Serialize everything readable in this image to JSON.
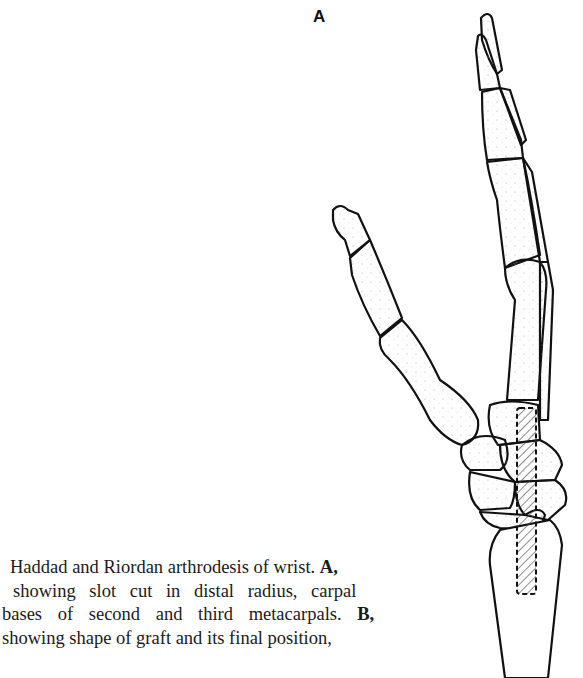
{
  "figure": {
    "panel_label": "A",
    "illustration": "Lateral view of hand and wrist bones: index and middle finger phalanges, metacarpals, carpals, distal radius with hatched slot (graft site) outlined by dashed line",
    "graft_hatch_color": "#333333",
    "line_color": "#111111"
  },
  "caption": {
    "lines": [
      {
        "text": "Haddad and Riordan arthrodesis of wrist. ",
        "bold": "A,"
      },
      {
        "text": "showing slot cut in distal radius, carpal",
        "bold": ""
      },
      {
        "text": "bases of second and third metacarpals. ",
        "bold": "B,"
      },
      {
        "text": "showing shape of graft and its final position,",
        "bold": ""
      }
    ]
  }
}
